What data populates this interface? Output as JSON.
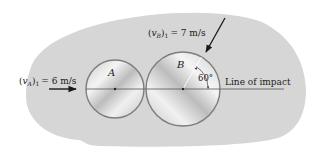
{
  "figure": {
    "background_color": "#d4d4d4",
    "disk_edge_color": "#7d7d7d",
    "disk_fill_light": "#f2f2f2",
    "disk_fill_dark": "#b8b8b8",
    "line_color": "#4a4a4a"
  },
  "labels": {
    "disk_a": "A",
    "disk_b": "B",
    "velocity_a": {
      "symbol": "v",
      "subscript": "A",
      "post": "1",
      "value": "= 6 m/s"
    },
    "velocity_b": {
      "symbol": "v",
      "subscript": "B",
      "post": "1",
      "value": "= 7 m/s"
    },
    "angle": "60°",
    "line_of_impact": "Line of impact"
  }
}
